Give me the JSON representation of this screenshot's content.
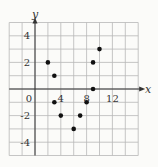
{
  "chart_data": {
    "type": "scatter",
    "title": "",
    "xlabel": "x",
    "ylabel": "y",
    "xlim": [
      -4,
      16
    ],
    "ylim": [
      -5,
      5
    ],
    "grid": true,
    "x_grid_step": 2,
    "y_grid_step": 1,
    "x_tick_labels": [
      "0",
      "4",
      "8",
      "12"
    ],
    "y_tick_labels": [
      "4",
      "2",
      "-2",
      "-4"
    ],
    "points": [
      {
        "x": 2,
        "y": 2
      },
      {
        "x": 3,
        "y": 1
      },
      {
        "x": 3,
        "y": -1
      },
      {
        "x": 4,
        "y": -2
      },
      {
        "x": 6,
        "y": -3
      },
      {
        "x": 7,
        "y": -2
      },
      {
        "x": 8,
        "y": -1
      },
      {
        "x": 9,
        "y": 0
      },
      {
        "x": 9,
        "y": 2
      },
      {
        "x": 10,
        "y": 3
      }
    ],
    "colors": {
      "grid": "#b8b8b8",
      "axis": "#333333",
      "point": "#111111"
    }
  }
}
